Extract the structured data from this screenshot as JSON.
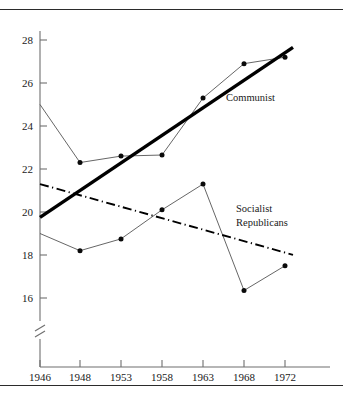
{
  "figure": {
    "caption_fragment": "",
    "border_color": "#2b2b2b"
  },
  "chart_data": {
    "type": "line",
    "title": "",
    "subtitle": "",
    "xlabel": "",
    "ylabel": "",
    "categories": [
      "1946",
      "1948",
      "1953",
      "1958",
      "1963",
      "1968",
      "1972"
    ],
    "x_tick_labels": [
      "1946",
      "1948",
      "1953",
      "1958",
      "1963",
      "1968",
      "1972"
    ],
    "y_tick_labels": [
      "16",
      "18",
      "20",
      "22",
      "24",
      "26",
      "28"
    ],
    "y_ticks": [
      16,
      18,
      20,
      22,
      24,
      26,
      28
    ],
    "ylim": [
      15.2,
      28.9
    ],
    "y_axis_break": true,
    "y_axis_break_note": "axis broken below 16",
    "grid": false,
    "legend_position": "inline-annotation",
    "series": [
      {
        "name": "Communist",
        "label": "Communist",
        "style": "markers-with-thin-connector",
        "values": [
          25.0,
          22.3,
          22.6,
          22.65,
          25.3,
          26.9,
          27.2
        ],
        "trend": {
          "style": "solid-thick",
          "color": "#000000",
          "start": {
            "x": "1946",
            "y": 19.75
          },
          "end": {
            "x": "1972",
            "y": 27.6
          }
        }
      },
      {
        "name": "Socialist Republicans",
        "label_lines": [
          "Socialist",
          "Republicans"
        ],
        "style": "markers-with-thin-connector",
        "values": [
          19.0,
          18.2,
          18.75,
          20.1,
          21.3,
          16.35,
          17.5
        ],
        "trend": {
          "style": "dash-dot",
          "color": "#000000",
          "start": {
            "x": "1946",
            "y": 21.3
          },
          "end": {
            "x": "1972",
            "y": 18.05
          }
        }
      }
    ],
    "annotations": [
      {
        "text": "Communist",
        "x": "1965",
        "y": 25.9
      },
      {
        "text": "Socialist",
        "x": "1967",
        "y": 20.4
      },
      {
        "text": "Republicans",
        "x": "1967",
        "y": 19.6
      }
    ]
  }
}
